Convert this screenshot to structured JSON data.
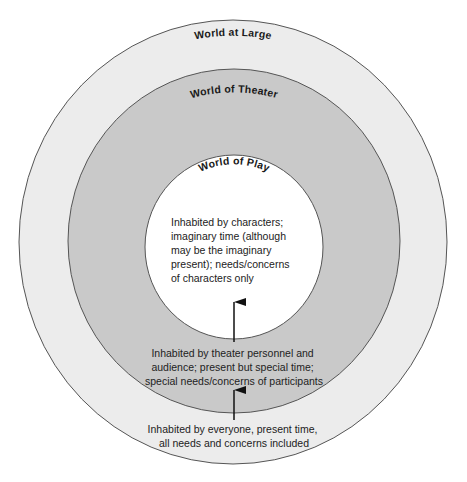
{
  "diagram": {
    "type": "concentric-circles",
    "colors": {
      "outer_fill": "#ececec",
      "middle_fill": "#c9c9c9",
      "inner_fill": "#ffffff",
      "stroke": "#555555",
      "arrow": "#111111",
      "text": "#222222"
    },
    "rings": [
      {
        "id": "world-at-large",
        "title": "World at Large",
        "description_lines": [
          "Inhabited by everyone, present time,",
          "all needs and concerns included"
        ]
      },
      {
        "id": "world-of-theater",
        "title": "World of Theater",
        "description_lines": [
          "Inhabited by theater personnel and",
          "audience; present but special time;",
          "special needs/concerns of participants"
        ]
      },
      {
        "id": "world-of-play",
        "title": "World of Play",
        "description_lines": [
          "Inhabited by characters;",
          "imaginary time (although",
          "may be the imaginary",
          "present); needs/concerns",
          "of characters only"
        ]
      }
    ],
    "arrows": [
      {
        "from": "world-at-large",
        "to": "world-of-theater"
      },
      {
        "from": "world-of-theater",
        "to": "world-of-play"
      }
    ]
  }
}
